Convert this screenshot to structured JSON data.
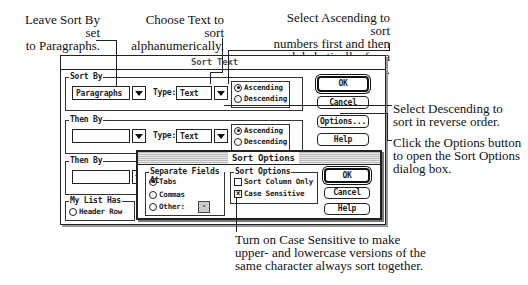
{
  "callouts": {
    "sort_by": [
      "Leave Sort By set",
      "to Paragraphs."
    ],
    "type_text": [
      "Choose Text to sort",
      "alphanumerically."
    ],
    "ascending": [
      "Select Ascending to sort",
      "numbers first and then",
      "alphabetically, from A–Z."
    ],
    "descending": [
      "Select Descending to",
      "sort in reverse order."
    ],
    "options": [
      "Click the Options button",
      "to open the Sort Options",
      "dialog box."
    ],
    "case_sensitive": [
      "Turn on Case Sensitive to make",
      "upper- and lowercase versions of the",
      "same character always sort together."
    ]
  },
  "sort_text_dialog": {
    "title": "Sort Text",
    "groups": [
      {
        "label": "Sort By",
        "field_value": "Paragraphs",
        "type_label": "Type:",
        "type_value": "Text",
        "ascending": "Ascending",
        "descending": "Descending",
        "selected": "Ascending"
      },
      {
        "label": "Then By",
        "field_value": "",
        "type_label": "Type:",
        "type_value": "Text",
        "ascending": "Ascending",
        "descending": "Descending",
        "selected": "Ascending"
      },
      {
        "label": "Then By",
        "field_value": ""
      }
    ],
    "my_list_has": {
      "label": "My List Has",
      "option": "Header Row"
    },
    "buttons": {
      "ok": "OK",
      "cancel": "Cancel",
      "options": "Options...",
      "help": "Help"
    }
  },
  "sort_options_dialog": {
    "title": "Sort Options",
    "separate_fields": {
      "label": "Separate Fields At",
      "options": [
        "Tabs",
        "Commas",
        "Other:"
      ],
      "selected": "Tabs",
      "other_value": "-"
    },
    "sort_options": {
      "label": "Sort Options",
      "sort_column_only": {
        "label": "Sort Column Only",
        "checked": false
      },
      "case_sensitive": {
        "label": "Case Sensitive",
        "checked": true
      }
    },
    "buttons": {
      "ok": "OK",
      "cancel": "Cancel",
      "help": "Help"
    }
  }
}
